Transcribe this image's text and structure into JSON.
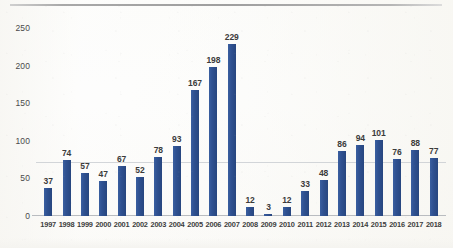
{
  "chart_data": {
    "type": "bar",
    "title": "",
    "subtitle": "",
    "xlabel": "",
    "ylabel": "",
    "ylim": [
      0,
      250
    ],
    "yticks": [
      0,
      50,
      100,
      150,
      200,
      250
    ],
    "grid": false,
    "legend": null,
    "categories": [
      "1997",
      "1998",
      "1999",
      "2000",
      "2001",
      "2002",
      "2003",
      "2004",
      "2005",
      "2006",
      "2007",
      "2008",
      "2009",
      "2010",
      "2011",
      "2012",
      "2013",
      "2014",
      "2015",
      "2016",
      "2017",
      "2018"
    ],
    "values": [
      37,
      74,
      57,
      47,
      67,
      52,
      78,
      93,
      167,
      198,
      229,
      12,
      3,
      12,
      33,
      48,
      86,
      94,
      101,
      76,
      88,
      77
    ],
    "data_labels": [
      "37",
      "74",
      "57",
      "47",
      "67",
      "52",
      "78",
      "93",
      "167",
      "198",
      "229",
      "12",
      "3",
      "12",
      "33",
      "48",
      "86",
      "94",
      "101",
      "76",
      "88",
      "77"
    ],
    "bar_color": "#2F5191",
    "annotations": []
  },
  "axes": {
    "y_tick_labels": [
      "250",
      "200",
      "150",
      "100",
      "50",
      "0"
    ]
  },
  "decor": {
    "top_rule": true,
    "faint_midline_value": 72
  }
}
